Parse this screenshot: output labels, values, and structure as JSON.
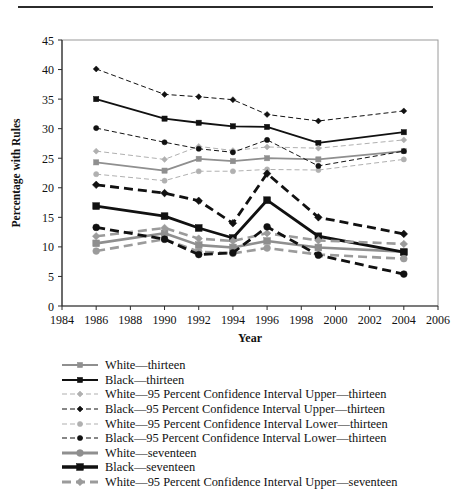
{
  "figure": {
    "rule_above": true
  },
  "chart_data": {
    "type": "line",
    "title": "",
    "xlabel": "Year",
    "ylabel": "Percentage with Rules",
    "xlim": [
      1984,
      2006
    ],
    "ylim": [
      0,
      45
    ],
    "ytick_step": 5,
    "xticks": [
      1984,
      1986,
      1988,
      1990,
      1992,
      1994,
      1996,
      1998,
      2000,
      2002,
      2004,
      2006
    ],
    "yticks": [
      0,
      5,
      10,
      15,
      20,
      25,
      30,
      35,
      40,
      45
    ],
    "grid": false,
    "legend_position": "below",
    "x": [
      1986,
      1990,
      1992,
      1994,
      1996,
      1999,
      2004
    ],
    "series": [
      {
        "name": "White—thirteen",
        "values": [
          24.3,
          22.9,
          24.9,
          24.5,
          25.0,
          24.8,
          26.2
        ],
        "color": "#8f8f8f",
        "style": "solid",
        "marker": "square",
        "width": 1.8
      },
      {
        "name": "Black—thirteen",
        "values": [
          35.0,
          31.7,
          31.0,
          30.4,
          30.3,
          27.6,
          29.4
        ],
        "color": "#111111",
        "style": "solid",
        "marker": "square",
        "width": 1.8
      },
      {
        "name": "White—95 Percent Confidence Interval Upper—thirteen",
        "values": [
          26.2,
          24.8,
          27.0,
          26.3,
          26.9,
          26.7,
          28.1
        ],
        "color": "#b0b0b0",
        "style": "dashed-fine",
        "marker": "diamond",
        "width": 1.0
      },
      {
        "name": "Black—95 Percent Confidence Interval Upper—thirteen",
        "values": [
          40.1,
          35.8,
          35.4,
          34.9,
          32.4,
          31.3,
          33.0
        ],
        "color": "#111111",
        "style": "dashed-fine",
        "marker": "diamond",
        "width": 1.0
      },
      {
        "name": "White—95 Percent Confidence Interval Lower—thirteen",
        "values": [
          22.3,
          21.2,
          22.8,
          22.8,
          23.1,
          23.0,
          24.8
        ],
        "color": "#b0b0b0",
        "style": "dashed-fine",
        "marker": "circle",
        "width": 1.0
      },
      {
        "name": "Black—95 Percent Confidence Interval Lower—thirteen",
        "values": [
          30.1,
          27.7,
          26.6,
          26.0,
          28.1,
          23.7,
          26.2
        ],
        "color": "#111111",
        "style": "dashed-fine",
        "marker": "circle",
        "width": 1.0
      },
      {
        "name": "White—seventeen",
        "values": [
          10.6,
          12.3,
          10.3,
          9.9,
          11.0,
          9.9,
          9.2
        ],
        "color": "#8f8f8f",
        "style": "solid",
        "marker": "square",
        "width": 2.6
      },
      {
        "name": "Black—seventeen",
        "values": [
          16.9,
          15.2,
          13.2,
          11.5,
          17.9,
          11.8,
          9.1
        ],
        "color": "#111111",
        "style": "solid",
        "marker": "square",
        "width": 2.8
      },
      {
        "name": "White—95 Percent Confidence Interval Upper—seventeen",
        "values": [
          11.8,
          13.2,
          11.4,
          11.0,
          12.3,
          11.1,
          10.5
        ],
        "color": "#9b9b9b",
        "style": "dashed-bold",
        "marker": "diamond",
        "width": 2.6
      },
      {
        "name": "Black—95 Percent Confidence Interval Upper—seventeen",
        "values": [
          20.5,
          19.1,
          17.8,
          14.0,
          22.4,
          15.0,
          12.2
        ],
        "color": "#111111",
        "style": "dashed-bold",
        "marker": "diamond",
        "width": 2.8
      },
      {
        "name": "White—95 Percent Confidence Interval Lower—seventeen",
        "values": [
          9.3,
          11.3,
          9.2,
          8.9,
          9.8,
          8.7,
          8.0
        ],
        "color": "#9b9b9b",
        "style": "dashed-bold",
        "marker": "circle",
        "width": 2.6
      },
      {
        "name": "Black—95 Percent Confidence Interval Lower—seventeen",
        "values": [
          13.3,
          11.3,
          8.7,
          9.0,
          13.4,
          8.6,
          5.4
        ],
        "color": "#111111",
        "style": "dashed-bold",
        "marker": "circle",
        "width": 2.8
      }
    ]
  },
  "legend": {
    "items": [
      {
        "label": "White—thirteen",
        "color": "#8f8f8f",
        "style": "solid",
        "marker": "square",
        "width": 2.0
      },
      {
        "label": "Black—thirteen",
        "color": "#111111",
        "style": "solid",
        "marker": "square",
        "width": 2.0
      },
      {
        "label": "White—95 Percent Confidence Interval Upper—thirteen",
        "color": "#b0b0b0",
        "style": "dashed-fine",
        "marker": "diamond",
        "width": 1.1
      },
      {
        "label": "Black—95 Percent Confidence Interval Upper—thirteen",
        "color": "#111111",
        "style": "dashed-fine",
        "marker": "diamond",
        "width": 1.1
      },
      {
        "label": "White—95 Percent Confidence Interval Lower—thirteen",
        "color": "#b0b0b0",
        "style": "dashed-fine",
        "marker": "circle",
        "width": 1.1
      },
      {
        "label": "Black—95 Percent Confidence Interval Lower—thirteen",
        "color": "#111111",
        "style": "dashed-fine",
        "marker": "circle",
        "width": 1.1
      },
      {
        "label": "White—seventeen",
        "color": "#8f8f8f",
        "style": "solid",
        "marker": "circle",
        "width": 3.0
      },
      {
        "label": "Black—seventeen",
        "color": "#111111",
        "style": "solid",
        "marker": "square",
        "width": 3.4
      },
      {
        "label": "White—95 Percent Confidence Interval Upper—seventeen",
        "color": "#9b9b9b",
        "style": "dashed-bold",
        "marker": "diamond",
        "width": 3.0
      }
    ]
  }
}
